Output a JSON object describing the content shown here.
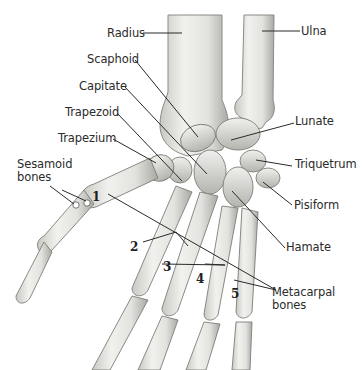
{
  "diagram": {
    "labels": {
      "radius": "Radius",
      "ulna": "Ulna",
      "scaphoid": "Scaphoid",
      "capitate": "Capitate",
      "trapezoid": "Trapezoid",
      "trapezium": "Trapezium",
      "sesamoid_1": "Sesamoid",
      "sesamoid_2": "bones",
      "lunate": "Lunate",
      "triquetrum": "Triquetrum",
      "pisiform": "Pisiform",
      "hamate": "Hamate",
      "metacarpal_1": "Metacarpal",
      "metacarpal_2": "bones"
    },
    "metacarpal_numbers": [
      "1",
      "2",
      "3",
      "4",
      "5"
    ],
    "colors": {
      "bone_fill": "#e9e9e6",
      "bone_shade": "#b9b9b4",
      "bone_outline": "#7d7d78",
      "leader_line": "#2a2a2a",
      "text": "#2b2b2b"
    }
  }
}
